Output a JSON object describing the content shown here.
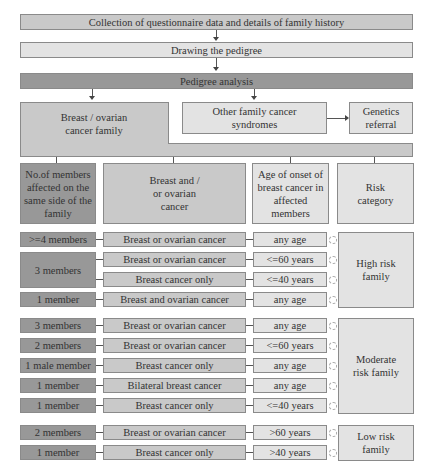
{
  "flow": {
    "step1": "Collection of questionnaire data and details of family history",
    "step2": "Drawing the pedigree",
    "step3": "Pedigree analysis",
    "breast_family": "Breast / ovarian cancer family",
    "other_syndromes": "Other family cancer syndromes",
    "genetics_referral": "Genetics referral"
  },
  "headers": {
    "members": "No.of members affected on the same side of the family",
    "cancer": "Breast and / or ovarian cancer",
    "age": "Age of onset of breast cancer in affected members",
    "risk": "Risk category"
  },
  "high_risk": {
    "label": "High risk family",
    "rows": [
      {
        "members": ">=4 members",
        "cancer": "Breast or ovarian cancer",
        "age": "any age"
      },
      {
        "members": "3 members",
        "cancer": "Breast or ovarian cancer",
        "age": "<=60 years"
      },
      {
        "members": "",
        "cancer": "Breast cancer only",
        "age": "<=40 years"
      },
      {
        "members": "1 member",
        "cancer": "Breast and ovarian cancer",
        "age": "any age"
      }
    ]
  },
  "moderate_risk": {
    "label": "Moderate risk family",
    "rows": [
      {
        "members": "3 members",
        "cancer": "Breast or ovarian cancer",
        "age": "any age"
      },
      {
        "members": "2 members",
        "cancer": "Breast or ovarian cancer",
        "age": "<=60 years"
      },
      {
        "members": "1 male member",
        "cancer": "Breast cancer only",
        "age": "any age"
      },
      {
        "members": "1 member",
        "cancer": "Bilateral breast cancer",
        "age": "any age"
      },
      {
        "members": "1 member",
        "cancer": "Breast cancer only",
        "age": "<=40 years"
      }
    ]
  },
  "low_risk": {
    "label": "Low risk family",
    "rows": [
      {
        "members": "2 members",
        "cancer": "Breast or ovarian cancer",
        "age": ">60 years"
      },
      {
        "members": "1 member",
        "cancer": "Breast cancer only",
        "age": ">40 years"
      }
    ]
  },
  "colors": {
    "light": "#e3e3e3",
    "mid": "#c9c9c9",
    "dark": "#a9a9a9",
    "border": "#8a8a8a"
  }
}
